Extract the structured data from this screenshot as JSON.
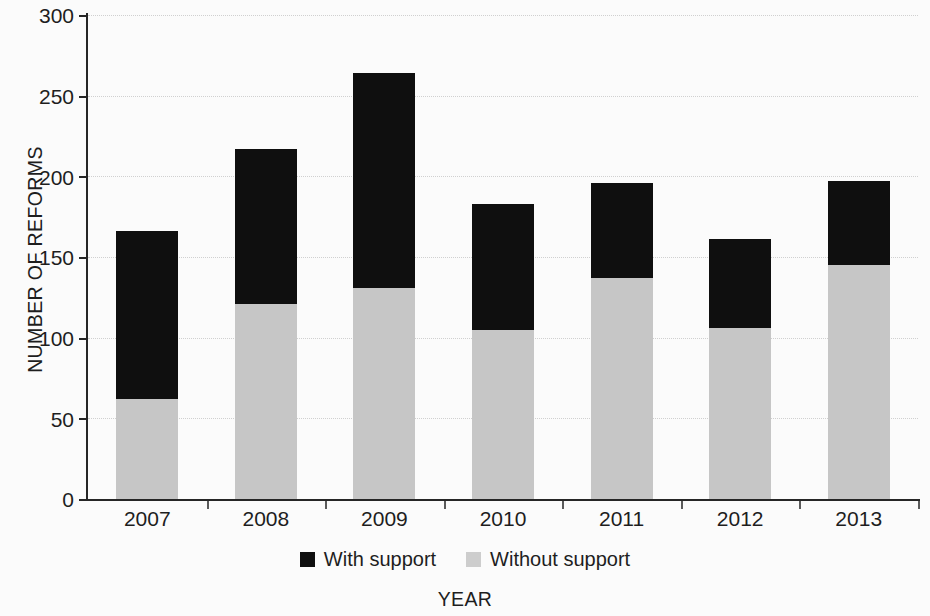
{
  "chart_data": {
    "type": "bar",
    "subtype": "stacked-vertical",
    "title": "",
    "xlabel": "YEAR",
    "ylabel": "NUMBER OF REFORMS",
    "categories": [
      "2007",
      "2008",
      "2009",
      "2010",
      "2011",
      "2012",
      "2013"
    ],
    "series": [
      {
        "name": "Without support",
        "color": "#c6c6c6",
        "values": [
          62,
          121,
          131,
          105,
          137,
          106,
          145
        ]
      },
      {
        "name": "With support",
        "color": "#0f0f0f",
        "values": [
          104,
          96,
          133,
          78,
          59,
          55,
          52
        ]
      }
    ],
    "totals": [
      166,
      217,
      264,
      183,
      196,
      161,
      197
    ],
    "ylim": [
      0,
      300
    ],
    "yticks": [
      0,
      50,
      100,
      150,
      200,
      250,
      300
    ],
    "ytick_labels": [
      "0",
      "50",
      "100",
      "150",
      "200",
      "250",
      "300"
    ],
    "grid": true,
    "grid_style": "dotted-horizontal",
    "legend_position": "bottom-center",
    "legend_entries": [
      "With support",
      "Without support"
    ],
    "background_color": "#fbfbfb",
    "axis_color": "#262626"
  }
}
